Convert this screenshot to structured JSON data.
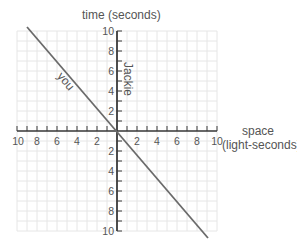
{
  "diagram": {
    "y_axis_label": "time (seconds)",
    "x_axis_label_line1": "space",
    "x_axis_label_line2": "(light-seconds)",
    "worldlines": [
      {
        "name": "Jackie",
        "label": "Jackie",
        "description": "vertical worldline along time axis"
      },
      {
        "name": "you",
        "label": "you",
        "description": "diagonal worldline through origin"
      }
    ],
    "x_ticks_left": [
      "10",
      "8",
      "6",
      "4",
      "2"
    ],
    "x_ticks_right": [
      "2",
      "4",
      "6",
      "8",
      "10"
    ],
    "y_ticks_up": [
      "10",
      "8",
      "6",
      "4",
      "2"
    ],
    "y_ticks_down": [
      "2",
      "4",
      "6",
      "8",
      "10"
    ],
    "colors": {
      "grid": "#e6e6e6",
      "axis": "#3a3a3a",
      "worldline": "#6a6a6a",
      "text": "#555555"
    }
  },
  "chart_data": {
    "type": "line",
    "title": "",
    "xlabel": "space (light-seconds)",
    "ylabel": "time (seconds)",
    "xlim": [
      -10,
      10
    ],
    "ylim": [
      -10,
      10
    ],
    "grid": true,
    "x_tick_labels": [
      "10",
      "8",
      "6",
      "4",
      "2",
      "",
      "2",
      "4",
      "6",
      "8",
      "10"
    ],
    "y_tick_labels": [
      "10",
      "8",
      "6",
      "4",
      "2",
      "",
      "2",
      "4",
      "6",
      "8",
      "10"
    ],
    "series": [
      {
        "name": "Jackie",
        "x": [
          0,
          0
        ],
        "y": [
          -10,
          10
        ]
      },
      {
        "name": "you",
        "x": [
          -9,
          9
        ],
        "y": [
          10,
          -10
        ]
      }
    ],
    "annotations": [
      "Jackie",
      "you"
    ]
  }
}
